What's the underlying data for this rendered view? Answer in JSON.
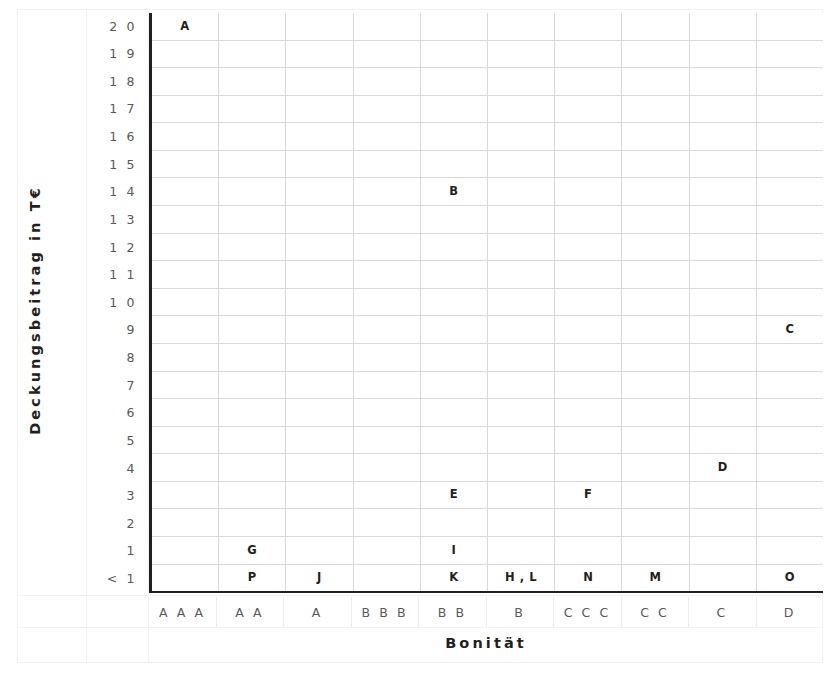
{
  "chart_data": {
    "type": "scatter",
    "title": "",
    "xlabel": "Bonität",
    "ylabel": "Deckungsbeitrag in T€",
    "grid": true,
    "legend": "none",
    "categories": [
      "A A A",
      "A A",
      "A",
      "B B B",
      "B B",
      "B",
      "C C C",
      "C C",
      "C",
      "D"
    ],
    "y_ticks": [
      "2 0",
      "1 9",
      "1 8",
      "1 7",
      "1 6",
      "1 5",
      "1 4",
      "1 3",
      "1 2",
      "1 1",
      "1 0",
      "9",
      "8",
      "7",
      "6",
      "5",
      "4",
      "3",
      "2",
      "1",
      "< 1"
    ],
    "ylim": [
      "< 1",
      "20"
    ],
    "points": [
      {
        "label": "A",
        "x": "A A A",
        "y": "20",
        "col": 0,
        "row": 0
      },
      {
        "label": "B",
        "x": "B B",
        "y": "14",
        "col": 4,
        "row": 6
      },
      {
        "label": "C",
        "x": "D",
        "y": "9",
        "col": 9,
        "row": 11
      },
      {
        "label": "D",
        "x": "C",
        "y": "4",
        "col": 8,
        "row": 16
      },
      {
        "label": "E",
        "x": "B B",
        "y": "3",
        "col": 4,
        "row": 17
      },
      {
        "label": "F",
        "x": "C C C",
        "y": "3",
        "col": 6,
        "row": 17
      },
      {
        "label": "G",
        "x": "A A",
        "y": "1",
        "col": 1,
        "row": 19
      },
      {
        "label": "I",
        "x": "B B",
        "y": "1",
        "col": 4,
        "row": 19
      },
      {
        "label": "P",
        "x": "A A",
        "y": "< 1",
        "col": 1,
        "row": 20
      },
      {
        "label": "J",
        "x": "A",
        "y": "< 1",
        "col": 2,
        "row": 20
      },
      {
        "label": "K",
        "x": "B B",
        "y": "< 1",
        "col": 4,
        "row": 20
      },
      {
        "label": "H , L",
        "x": "B",
        "y": "< 1",
        "col": 5,
        "row": 20
      },
      {
        "label": "N",
        "x": "C C C",
        "y": "< 1",
        "col": 6,
        "row": 20
      },
      {
        "label": "M",
        "x": "C C",
        "y": "< 1",
        "col": 7,
        "row": 20
      },
      {
        "label": "O",
        "x": "D",
        "y": "< 1",
        "col": 9,
        "row": 20
      }
    ],
    "colors": {
      "axis": "#231f20",
      "gridline": "#d8d9da",
      "tick_text": "#58595b",
      "label_text": "#231f20",
      "background": "#ffffff"
    }
  }
}
